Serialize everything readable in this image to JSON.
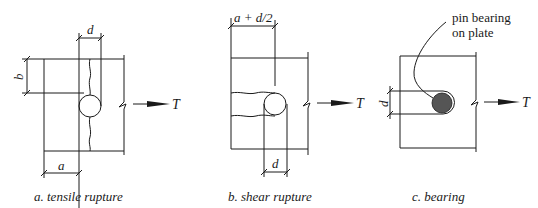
{
  "figure": {
    "panels": [
      {
        "id": "a",
        "caption": "a. tensile rupture",
        "labels": {
          "d": "d",
          "b": "b",
          "a": "a",
          "force": "T"
        }
      },
      {
        "id": "b",
        "caption": "b. shear rupture",
        "labels": {
          "top_dim": "a + d/2",
          "d": "d",
          "force": "T"
        }
      },
      {
        "id": "c",
        "caption": "c. bearing",
        "labels": {
          "d": "d",
          "force": "T",
          "note_line1": "pin bearing",
          "note_line2": "on plate"
        }
      }
    ],
    "colors": {
      "line": "#1a1a1a",
      "pin_fill": "#555555",
      "background": "#ffffff"
    }
  }
}
